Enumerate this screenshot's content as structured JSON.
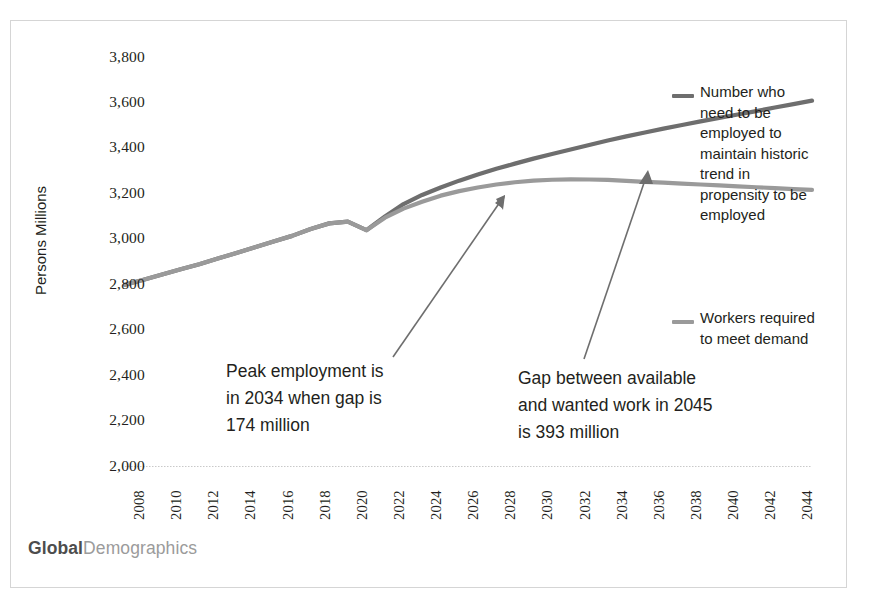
{
  "figure": {
    "brand_bold": "Global",
    "brand_rest": "Demographics",
    "background": "#ffffff",
    "frame_color": "#d5d5d5"
  },
  "chart_data": {
    "type": "line",
    "title": "",
    "xlabel": "",
    "ylabel": "Persons Millions",
    "xlim": [
      2008,
      2045
    ],
    "ylim": [
      2000,
      3800
    ],
    "ytick_step": 200,
    "xtick_step": 2,
    "grid": false,
    "legend_position": "right",
    "categories": [
      2008,
      2010,
      2012,
      2014,
      2016,
      2018,
      2020,
      2022,
      2024,
      2026,
      2028,
      2030,
      2032,
      2034,
      2036,
      2038,
      2040,
      2042,
      2044
    ],
    "yticks": [
      "3,800",
      "3,600",
      "3,400",
      "3,200",
      "3,000",
      "2,800",
      "2,600",
      "2,400",
      "2,200",
      "2,000"
    ],
    "xticks": [
      "2008",
      "2010",
      "2012",
      "2014",
      "2016",
      "2018",
      "2020",
      "2022",
      "2024",
      "2026",
      "2028",
      "2030",
      "2032",
      "2034",
      "2036",
      "2038",
      "2040",
      "2042",
      "2044"
    ],
    "series": [
      {
        "name": "Number who need to be employed to maintain historic trend in propensity to be employed",
        "color": "#6e6e6e",
        "x": [
          2008,
          2009,
          2010,
          2011,
          2012,
          2013,
          2014,
          2015,
          2016,
          2017,
          2018,
          2019,
          2020,
          2021,
          2022,
          2023,
          2024,
          2025,
          2026,
          2027,
          2028,
          2029,
          2030,
          2031,
          2032,
          2033,
          2034,
          2035,
          2036,
          2037,
          2038,
          2039,
          2040,
          2041,
          2042,
          2043,
          2044,
          2045
        ],
        "values": [
          2800,
          2822,
          2845,
          2868,
          2890,
          2915,
          2940,
          2965,
          2990,
          3015,
          3045,
          3070,
          3078,
          3040,
          3100,
          3155,
          3195,
          3228,
          3258,
          3285,
          3310,
          3333,
          3355,
          3375,
          3395,
          3415,
          3435,
          3453,
          3470,
          3487,
          3503,
          3519,
          3534,
          3549,
          3564,
          3580,
          3595,
          3610
        ]
      },
      {
        "name": "Workers required to meet demand",
        "color": "#9a9a9a",
        "x": [
          2008,
          2009,
          2010,
          2011,
          2012,
          2013,
          2014,
          2015,
          2016,
          2017,
          2018,
          2019,
          2020,
          2021,
          2022,
          2023,
          2024,
          2025,
          2026,
          2027,
          2028,
          2029,
          2030,
          2031,
          2032,
          2033,
          2034,
          2035,
          2036,
          2037,
          2038,
          2039,
          2040,
          2041,
          2042,
          2043,
          2044,
          2045
        ],
        "values": [
          2800,
          2822,
          2845,
          2868,
          2890,
          2915,
          2940,
          2965,
          2990,
          3015,
          3045,
          3070,
          3078,
          3040,
          3095,
          3135,
          3165,
          3192,
          3212,
          3228,
          3241,
          3251,
          3258,
          3262,
          3264,
          3263,
          3261,
          3257,
          3253,
          3249,
          3245,
          3241,
          3237,
          3233,
          3229,
          3225,
          3221,
          3217
        ]
      }
    ],
    "annotations": [
      {
        "id": "peak-employment",
        "lines": [
          "Peak employment is",
          "in 2034 when gap is",
          "174 million"
        ],
        "value_year": 2034,
        "value_gap_million": 174
      },
      {
        "id": "gap-2045",
        "lines": [
          "Gap between available",
          "and wanted work in 2045",
          "is 393 million"
        ],
        "value_year": 2045,
        "value_gap_million": 393
      }
    ],
    "legend": [
      {
        "id": "legend-need-employed",
        "color": "#6e6e6e",
        "lines": [
          "Number who",
          "need to be",
          "employed to",
          "maintain historic",
          "trend in",
          "propensity to be",
          "employed"
        ]
      },
      {
        "id": "legend-workers-required",
        "color": "#9a9a9a",
        "lines": [
          "Workers required",
          "to meet demand"
        ]
      }
    ]
  }
}
